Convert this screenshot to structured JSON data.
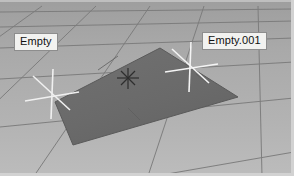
{
  "window": {
    "title": "3D Viewport",
    "width": 294,
    "height": 176
  },
  "viewport": {
    "shading": "solid",
    "background_color": "#b3b3b3",
    "grid_color": "#7c7c7c",
    "grid_floor_color": "#ababab",
    "horizon_color": "#9d9d9d"
  },
  "objects": [
    {
      "name": "Empty",
      "type": "empty-plain-axes",
      "label": "Empty",
      "gizmo_color": "#f0f0f0",
      "screen_x": 52,
      "screen_y": 96,
      "label_x": 14,
      "label_y": 33
    },
    {
      "name": "Empty.001",
      "type": "empty-plain-axes",
      "label": "Empty.001",
      "gizmo_color": "#f4f4f4",
      "screen_x": 190,
      "screen_y": 68,
      "label_x": 202,
      "label_y": 32
    }
  ],
  "plane": {
    "name": "Plane",
    "fill_color": "#6d6d6d",
    "edge_color": "#5a5a5a",
    "vertices": [
      [
        160,
        48
      ],
      [
        238,
        97
      ],
      [
        73,
        145
      ],
      [
        55,
        102
      ]
    ]
  },
  "cursor_3d": {
    "name": "3D Cursor",
    "color": "#2e2e2e",
    "screen_x": 128,
    "screen_y": 78
  }
}
